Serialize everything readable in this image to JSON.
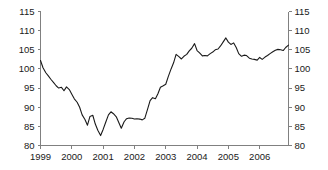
{
  "chart_data": {
    "type": "line",
    "title": "",
    "subtitle": "",
    "xlabel": "",
    "ylabel": "",
    "xlim": [
      1999.0,
      2006.92
    ],
    "ylim": [
      80,
      115
    ],
    "grid": false,
    "legend": null,
    "y_ticks": [
      80,
      85,
      90,
      95,
      100,
      105,
      110,
      115
    ],
    "y_ticks_right": [
      80,
      85,
      90,
      95,
      100,
      105,
      110,
      115
    ],
    "x_ticks": [
      1999,
      2000,
      2001,
      2002,
      2003,
      2004,
      2005,
      2006
    ],
    "x_tick_labels": [
      "1999",
      "2000",
      "2001",
      "2002",
      "2003",
      "2004",
      "2005",
      "2006"
    ],
    "series": [
      {
        "name": "index",
        "color": "#1a1a1a",
        "x": [
          1999.0,
          1999.08,
          1999.17,
          1999.25,
          1999.33,
          1999.42,
          1999.5,
          1999.58,
          1999.67,
          1999.75,
          1999.83,
          1999.92,
          2000.0,
          2000.08,
          2000.17,
          2000.25,
          2000.33,
          2000.42,
          2000.5,
          2000.58,
          2000.67,
          2000.75,
          2000.83,
          2000.92,
          2001.0,
          2001.08,
          2001.17,
          2001.25,
          2001.33,
          2001.42,
          2001.5,
          2001.58,
          2001.67,
          2001.75,
          2001.83,
          2001.92,
          2002.0,
          2002.08,
          2002.17,
          2002.25,
          2002.33,
          2002.42,
          2002.5,
          2002.58,
          2002.67,
          2002.75,
          2002.83,
          2002.92,
          2003.0,
          2003.08,
          2003.17,
          2003.25,
          2003.33,
          2003.42,
          2003.5,
          2003.58,
          2003.67,
          2003.75,
          2003.83,
          2003.92,
          2004.0,
          2004.08,
          2004.17,
          2004.25,
          2004.33,
          2004.42,
          2004.5,
          2004.58,
          2004.67,
          2004.75,
          2004.83,
          2004.92,
          2005.0,
          2005.08,
          2005.17,
          2005.25,
          2005.33,
          2005.42,
          2005.5,
          2005.58,
          2005.67,
          2005.75,
          2005.83,
          2005.92,
          2006.0,
          2006.08,
          2006.17,
          2006.25,
          2006.33,
          2006.42,
          2006.5,
          2006.58,
          2006.67,
          2006.75,
          2006.83,
          2006.92
        ],
        "values": [
          102.2,
          100.3,
          99.0,
          98.2,
          97.3,
          96.4,
          95.6,
          95.0,
          95.2,
          94.3,
          95.3,
          94.6,
          93.4,
          92.2,
          91.3,
          90.0,
          88.0,
          86.8,
          85.3,
          87.6,
          87.9,
          85.6,
          84.0,
          82.6,
          84.2,
          86.0,
          88.0,
          88.8,
          88.3,
          87.5,
          86.0,
          84.5,
          86.2,
          87.0,
          87.2,
          87.1,
          86.9,
          87.0,
          86.9,
          86.7,
          87.1,
          89.5,
          91.7,
          92.5,
          92.2,
          93.5,
          95.2,
          95.6,
          96.0,
          98.0,
          100.0,
          101.6,
          103.8,
          103.2,
          102.6,
          103.3,
          103.8,
          104.7,
          105.4,
          106.6,
          104.8,
          104.2,
          103.4,
          103.5,
          103.4,
          104.0,
          104.4,
          105.0,
          105.2,
          106.0,
          107.0,
          108.1,
          107.0,
          106.4,
          106.8,
          105.6,
          104.0,
          103.3,
          103.6,
          103.5,
          102.8,
          102.6,
          102.5,
          102.3,
          103.0,
          102.5,
          103.1,
          103.5,
          104.0,
          104.5,
          104.9,
          105.1,
          105.0,
          104.8,
          105.6,
          106.2
        ]
      }
    ]
  }
}
